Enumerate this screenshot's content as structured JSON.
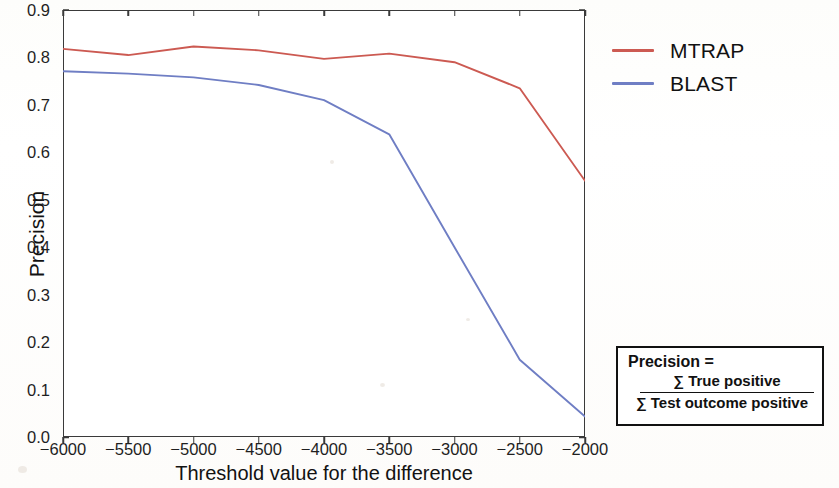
{
  "chart_data": {
    "type": "line",
    "title": "",
    "xlabel": "Threshold value for the difference",
    "ylabel": "Precision",
    "xlim": [
      -6000,
      -2000
    ],
    "ylim": [
      0.0,
      0.9
    ],
    "grid": false,
    "legend_position": "right",
    "x": [
      -6000,
      -5500,
      -5000,
      -4500,
      -4000,
      -3500,
      -3000,
      -2500,
      -2000
    ],
    "xticklabels": [
      "−6000",
      "−5500",
      "−5000",
      "−4500",
      "−4000",
      "−3500",
      "−3000",
      "−2500",
      "−2000"
    ],
    "yticks": [
      0.0,
      0.1,
      0.2,
      0.3,
      0.4,
      0.5,
      0.6,
      0.7,
      0.8,
      0.9
    ],
    "yticklabels": [
      "0.0",
      "0.1",
      "0.2",
      "0.3",
      "0.4",
      "0.5",
      "0.6",
      "0.7",
      "0.8",
      "0.9"
    ],
    "series": [
      {
        "name": "MTRAP",
        "color": "#cc5a52",
        "values": [
          0.818,
          0.805,
          0.823,
          0.815,
          0.797,
          0.808,
          0.79,
          0.735,
          0.54
        ]
      },
      {
        "name": "BLAST",
        "color": "#6f7ec4",
        "values": [
          0.771,
          0.766,
          0.758,
          0.742,
          0.71,
          0.638,
          0.4,
          0.163,
          0.043
        ]
      }
    ]
  },
  "legend": {
    "items": [
      {
        "label": "MTRAP",
        "color": "#cc5a52"
      },
      {
        "label": "BLAST",
        "color": "#6f7ec4"
      }
    ]
  },
  "formula_box": {
    "heading": "Precision =",
    "numerator": "∑ True positive",
    "denominator": "∑ Test outcome positive"
  }
}
